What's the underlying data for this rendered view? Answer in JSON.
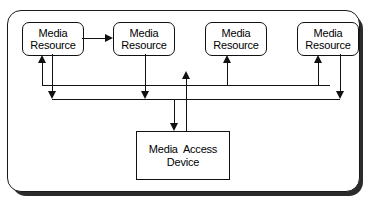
{
  "diagram": {
    "container": {
      "shape": "rounded-rectangle",
      "border_color": "#111111",
      "fill": "#ffffff",
      "shadow_color": "#2b2b2b"
    },
    "resources": [
      {
        "line1": "Media",
        "line2": "Resource",
        "x": 22,
        "y": 22,
        "w": 60,
        "h": 32
      },
      {
        "line1": "Media",
        "line2": "Resource",
        "x": 113,
        "y": 22,
        "w": 60,
        "h": 32
      },
      {
        "line1": "Media",
        "line2": "Resource",
        "x": 205,
        "y": 22,
        "w": 60,
        "h": 32
      },
      {
        "line1": "Media",
        "line2": "Resource",
        "x": 297,
        "y": 22,
        "w": 60,
        "h": 32
      }
    ],
    "device": {
      "line1": "Media  Access",
      "line2": "Device",
      "x": 136,
      "y": 131,
      "w": 92,
      "h": 47
    },
    "bus": {
      "upper_line_y": 85,
      "lower_line_y": 99,
      "upper_line_x1": 42,
      "upper_line_x2": 330,
      "lower_line_x1": 52,
      "lower_line_x2": 340
    },
    "connections": [
      {
        "from": "resource-1",
        "to": "resource-2",
        "kind": "horizontal-arrow",
        "direction": "right"
      },
      {
        "from": "upper-bus",
        "to": "resource-1",
        "kind": "vertical-arrow",
        "direction": "up"
      },
      {
        "from": "upper-bus",
        "to": "resource-3",
        "kind": "vertical-arrow",
        "direction": "up"
      },
      {
        "from": "upper-bus",
        "to": "resource-4",
        "kind": "vertical-arrow",
        "direction": "up"
      },
      {
        "from": "resource-1",
        "to": "lower-bus",
        "kind": "vertical-arrow",
        "direction": "down"
      },
      {
        "from": "resource-2",
        "to": "lower-bus",
        "kind": "vertical-arrow",
        "direction": "down"
      },
      {
        "from": "resource-4",
        "to": "lower-bus",
        "kind": "vertical-arrow",
        "direction": "down"
      },
      {
        "from": "lower-bus",
        "to": "media-access-device",
        "kind": "vertical-arrow",
        "direction": "down"
      },
      {
        "from": "media-access-device",
        "to": "upper-bus",
        "kind": "vertical-arrow",
        "direction": "up"
      }
    ]
  }
}
